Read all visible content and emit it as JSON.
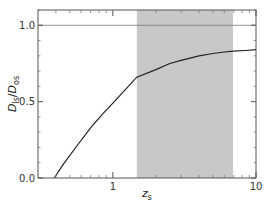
{
  "chart_data": {
    "type": "line",
    "title": "",
    "xlabel": "z_s",
    "xlabel_main": "z",
    "xlabel_sub": "s",
    "ylabel": "D_ls/D_os",
    "ylabel_parts": {
      "d1": "D",
      "sub1": "ls",
      "slash": "/",
      "d2": "D",
      "sub2": "os"
    },
    "xscale": "log",
    "xlim": [
      0.3,
      10
    ],
    "ylim": [
      0.0,
      1.1
    ],
    "x_ticks": [
      {
        "value": 1,
        "label": "1"
      },
      {
        "value": 10,
        "label": "10"
      }
    ],
    "y_ticks": [
      {
        "value": 0.0,
        "label": "0.0"
      },
      {
        "value": 0.5,
        "label": "0.5"
      },
      {
        "value": 1.0,
        "label": "1.0"
      }
    ],
    "grid": false,
    "legend": null,
    "reference_line": {
      "y": 1.0
    },
    "shaded_region": {
      "x_start": 1.47,
      "x_end": 6.9,
      "color": "#c8c8c8"
    },
    "series": [
      {
        "name": "D_ls/D_os",
        "x": [
          0.39,
          0.45,
          0.55,
          0.7,
          0.85,
          1.0,
          1.2,
          1.47,
          2.0,
          2.5,
          3.0,
          4.0,
          5.0,
          6.0,
          7.0,
          8.5,
          10.0
        ],
        "values": [
          0.0,
          0.09,
          0.2,
          0.33,
          0.42,
          0.49,
          0.57,
          0.66,
          0.71,
          0.75,
          0.77,
          0.8,
          0.815,
          0.825,
          0.83,
          0.835,
          0.84
        ]
      }
    ]
  }
}
